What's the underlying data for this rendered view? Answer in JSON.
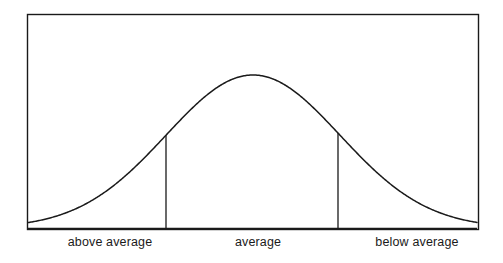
{
  "figure": {
    "background_color": "#ffffff",
    "line_color": "#1a1a1a",
    "frame": {
      "name": "plot-frame",
      "left": 27,
      "top": 14,
      "right": 478,
      "bottom": 229,
      "stroke_width": 1.4
    }
  },
  "labels": {
    "above_average": "above average",
    "average": "average",
    "below_average": "below average"
  },
  "chart_data": {
    "type": "line",
    "title": "",
    "subtitle": "",
    "xlabel": "",
    "ylabel": "",
    "grid": false,
    "legend": "none",
    "curve": {
      "name": "bell-curve",
      "distribution": "normal",
      "mean_x": 253,
      "sigma_px": 87,
      "peak_y": 75,
      "baseline_y": 228,
      "x_start": 28,
      "x_end": 477,
      "stroke_color": "#1a1a1a",
      "stroke_width": 1.5,
      "fill": "none"
    },
    "dividers": [
      {
        "name": "divider-left",
        "x": 166,
        "y_top": 169,
        "y_bottom": 229,
        "stroke_color": "#1a1a1a",
        "stroke_width": 1.3
      },
      {
        "name": "divider-right",
        "x": 338,
        "y_top": 169,
        "y_bottom": 229,
        "stroke_color": "#1a1a1a",
        "stroke_width": 1.3
      }
    ],
    "regions": [
      {
        "label": "above average",
        "x_from": 27,
        "x_to": 166,
        "center_x": 110
      },
      {
        "label": "average",
        "x_from": 166,
        "x_to": 338,
        "center_x": 258
      },
      {
        "label": "below average",
        "x_from": 338,
        "x_to": 478,
        "center_x": 417
      }
    ],
    "x": [
      28,
      50,
      72,
      94,
      116,
      138,
      160,
      182,
      204,
      226,
      253,
      280,
      302,
      324,
      346,
      368,
      390,
      412,
      434,
      456,
      477
    ],
    "y": [
      228,
      227,
      226,
      223,
      218,
      210,
      198,
      180,
      156,
      128,
      75,
      128,
      156,
      180,
      198,
      210,
      218,
      223,
      226,
      227,
      228
    ],
    "ylim": [
      228,
      75
    ],
    "xlim": [
      27,
      478
    ]
  }
}
